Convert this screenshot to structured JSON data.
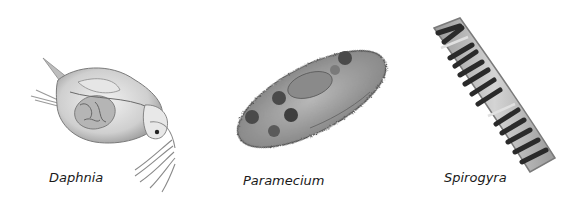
{
  "organisms": [
    {
      "name": "Daphnia",
      "label": "Daphnia"
    },
    {
      "name": "Paramecium",
      "label": "Paramecium"
    },
    {
      "name": "Spirogyra",
      "label": "Spirogyra"
    }
  ],
  "colors": {
    "background": "#ffffff",
    "label_text": "#1a1a1a",
    "illustration_dark": "#2a2a2a",
    "illustration_mid": "#8a8a8a",
    "illustration_light": "#d8d8d8"
  }
}
